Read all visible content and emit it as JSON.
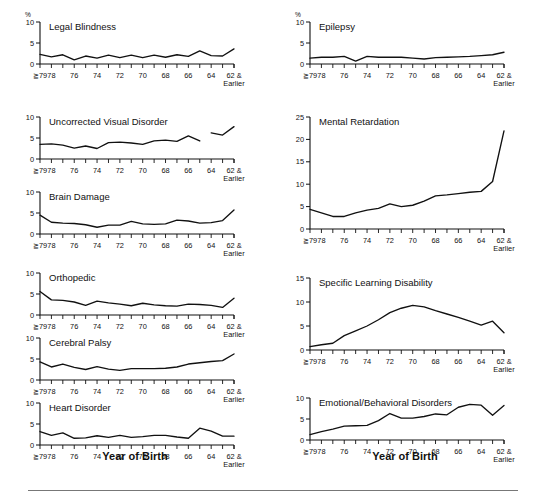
{
  "figure": {
    "axis_caption_left": "Year of Birth",
    "axis_caption_right": "Year of Birth",
    "percent_symbol": "%"
  },
  "x_axis": {
    "label": "Year of Birth",
    "tick_labels": [
      "≧79",
      "78",
      "",
      "76",
      "",
      "74",
      "",
      "72",
      "",
      "70",
      "",
      "68",
      "",
      "66",
      "",
      "64",
      "",
      "62 &"
    ],
    "end_label_line2": "Earlier",
    "categories": [
      "≧79",
      "78",
      "77",
      "76",
      "75",
      "74",
      "73",
      "72",
      "71",
      "70",
      "69",
      "68",
      "67",
      "66",
      "65",
      "64",
      "63",
      "62 & Earlier"
    ],
    "n_ticks": 18
  },
  "chart_data": [
    {
      "type": "line",
      "title": "Legal Blindness",
      "column": "left",
      "ylabel": "%",
      "ylim": [
        0,
        10
      ],
      "yticks": [
        0,
        5,
        10
      ],
      "xlabel": "Year of Birth",
      "grid": false,
      "legend": "none",
      "categories": [
        "≧79",
        "78",
        "77",
        "76",
        "75",
        "74",
        "73",
        "72",
        "71",
        "70",
        "69",
        "68",
        "67",
        "66",
        "65",
        "64",
        "63",
        "62 & Earlier"
      ],
      "values": [
        2.3,
        1.7,
        2.2,
        1.0,
        1.9,
        1.4,
        2.1,
        1.5,
        2.1,
        1.5,
        2.1,
        1.6,
        2.2,
        1.8,
        3.1,
        2.0,
        1.9,
        3.6
      ]
    },
    {
      "type": "line",
      "title": "Uncorrected Visual Disorder",
      "column": "left",
      "ylabel": "%",
      "ylim": [
        0,
        10
      ],
      "yticks": [
        0,
        5,
        10
      ],
      "xlabel": "Year of Birth",
      "grid": false,
      "legend": "none",
      "note": "line has a break between the 66 and 64 segments",
      "categories": [
        "≧79",
        "78",
        "77",
        "76",
        "75",
        "74",
        "73",
        "72",
        "71",
        "70",
        "69",
        "68",
        "67",
        "66",
        "65",
        "64",
        "63",
        "62 & Earlier"
      ],
      "values": [
        3.5,
        3.6,
        3.3,
        2.6,
        3.1,
        2.5,
        3.9,
        4.0,
        3.8,
        3.5,
        4.3,
        4.5,
        4.2,
        5.5,
        4.3,
        null,
        6.2,
        5.7,
        7.7
      ],
      "segments": [
        {
          "start_index": 0,
          "values": [
            3.5,
            3.6,
            3.3,
            2.6,
            3.1,
            2.5,
            3.9,
            4.0,
            3.8,
            3.5,
            4.3,
            4.5,
            4.2,
            5.5,
            4.3
          ]
        },
        {
          "start_index": 15,
          "values": [
            6.2,
            5.7,
            7.7
          ]
        }
      ]
    },
    {
      "type": "line",
      "title": "Brain Damage",
      "column": "left",
      "ylabel": "%",
      "ylim": [
        0,
        10
      ],
      "yticks": [
        0,
        5,
        10
      ],
      "xlabel": "Year of Birth",
      "grid": false,
      "legend": "none",
      "categories": [
        "≧79",
        "78",
        "77",
        "76",
        "75",
        "74",
        "73",
        "72",
        "71",
        "70",
        "69",
        "68",
        "67",
        "66",
        "65",
        "64",
        "63",
        "62 & Earlier"
      ],
      "values": [
        4.5,
        2.8,
        2.6,
        2.5,
        2.2,
        1.6,
        2.1,
        2.1,
        3.0,
        2.4,
        2.3,
        2.4,
        3.3,
        3.1,
        2.6,
        2.7,
        3.2,
        5.7
      ]
    },
    {
      "type": "line",
      "title": "Orthopedic",
      "column": "left",
      "ylabel": "%",
      "ylim": [
        0,
        10
      ],
      "yticks": [
        0,
        5,
        10
      ],
      "xlabel": "Year of Birth",
      "grid": false,
      "legend": "none",
      "categories": [
        "≧79",
        "78",
        "77",
        "76",
        "75",
        "74",
        "73",
        "72",
        "71",
        "70",
        "69",
        "68",
        "67",
        "66",
        "65",
        "64",
        "63",
        "62 & Earlier"
      ],
      "values": [
        5.6,
        3.6,
        3.5,
        3.1,
        2.3,
        3.3,
        2.9,
        2.6,
        2.2,
        2.8,
        2.4,
        2.2,
        2.1,
        2.6,
        2.5,
        2.3,
        1.8,
        4.0
      ]
    },
    {
      "type": "line",
      "title": "Cerebral Palsy",
      "column": "left",
      "ylabel": "%",
      "ylim": [
        0,
        10
      ],
      "yticks": [
        0,
        5,
        10
      ],
      "xlabel": "Year of Birth",
      "grid": false,
      "legend": "none",
      "categories": [
        "≧79",
        "78",
        "77",
        "76",
        "75",
        "74",
        "73",
        "72",
        "71",
        "70",
        "69",
        "68",
        "67",
        "66",
        "65",
        "64",
        "63",
        "62 & Earlier"
      ],
      "values": [
        4.3,
        3.1,
        3.8,
        3.0,
        2.5,
        3.2,
        2.6,
        2.3,
        2.7,
        2.7,
        2.7,
        2.8,
        3.1,
        3.8,
        4.1,
        4.4,
        4.6,
        6.2
      ]
    },
    {
      "type": "line",
      "title": "Heart Disorder",
      "column": "left",
      "ylabel": "%",
      "ylim": [
        0,
        10
      ],
      "yticks": [
        0,
        5,
        10
      ],
      "xlabel": "Year of Birth",
      "grid": false,
      "legend": "none",
      "categories": [
        "≧79",
        "78",
        "77",
        "76",
        "75",
        "74",
        "73",
        "72",
        "71",
        "70",
        "69",
        "68",
        "67",
        "66",
        "65",
        "64",
        "63",
        "62 & Earlier"
      ],
      "values": [
        3.2,
        2.3,
        2.9,
        1.6,
        1.7,
        2.2,
        1.8,
        2.3,
        1.8,
        2.0,
        2.3,
        2.3,
        1.9,
        1.6,
        4.0,
        3.3,
        2.1,
        2.1
      ]
    },
    {
      "type": "line",
      "title": "Epilepsy",
      "column": "right",
      "ylabel": "%",
      "ylim": [
        0,
        10
      ],
      "yticks": [
        0,
        5,
        10
      ],
      "xlabel": "Year of Birth",
      "grid": false,
      "legend": "none",
      "categories": [
        "≧79",
        "78",
        "77",
        "76",
        "75",
        "74",
        "73",
        "72",
        "71",
        "70",
        "69",
        "68",
        "67",
        "66",
        "65",
        "64",
        "63",
        "62 & Earlier"
      ],
      "values": [
        1.4,
        1.6,
        1.6,
        1.8,
        0.7,
        1.8,
        1.6,
        1.6,
        1.6,
        1.4,
        1.2,
        1.5,
        1.6,
        1.7,
        1.8,
        2.0,
        2.2,
        2.8
      ]
    },
    {
      "type": "line",
      "title": "Mental Retardation",
      "column": "right",
      "ylabel": "%",
      "ylim": [
        0,
        25
      ],
      "yticks": [
        0,
        5,
        10,
        15,
        20,
        25
      ],
      "xlabel": "Year of Birth",
      "grid": false,
      "legend": "none",
      "categories": [
        "≧79",
        "78",
        "77",
        "76",
        "75",
        "74",
        "73",
        "72",
        "71",
        "70",
        "69",
        "68",
        "67",
        "66",
        "65",
        "64",
        "63",
        "62 & Earlier"
      ],
      "values": [
        4.4,
        3.6,
        2.8,
        2.8,
        3.6,
        4.2,
        4.6,
        5.6,
        5.0,
        5.3,
        6.2,
        7.4,
        7.6,
        7.9,
        8.2,
        8.4,
        10.6,
        21.9
      ]
    },
    {
      "type": "line",
      "title": "Specific Learning Disability",
      "column": "right",
      "ylabel": "%",
      "ylim": [
        0,
        15
      ],
      "yticks": [
        0,
        5,
        10,
        15
      ],
      "xlabel": "Year of Birth",
      "grid": false,
      "legend": "none",
      "categories": [
        "≧79",
        "78",
        "77",
        "76",
        "75",
        "74",
        "73",
        "72",
        "71",
        "70",
        "69",
        "68",
        "67",
        "66",
        "65",
        "64",
        "63",
        "62 & Earlier"
      ],
      "values": [
        0.7,
        1.1,
        1.4,
        3.0,
        4.0,
        5.0,
        6.3,
        7.8,
        8.7,
        9.3,
        9.0,
        8.2,
        7.5,
        6.8,
        6.0,
        5.2,
        6.0,
        3.6
      ]
    },
    {
      "type": "line",
      "title": "Emotional/Behavioral Disorders",
      "column": "right",
      "ylabel": "%",
      "ylim": [
        0,
        10
      ],
      "yticks": [
        0,
        5,
        10
      ],
      "xlabel": "Year of Birth",
      "grid": false,
      "legend": "none",
      "categories": [
        "≧79",
        "78",
        "77",
        "76",
        "75",
        "74",
        "73",
        "72",
        "71",
        "70",
        "69",
        "68",
        "67",
        "66",
        "65",
        "64",
        "63",
        "62 & Earlier"
      ],
      "values": [
        1.3,
        2.0,
        2.6,
        3.3,
        3.4,
        3.5,
        4.6,
        6.3,
        5.2,
        5.2,
        5.6,
        6.2,
        6.0,
        7.8,
        8.5,
        8.3,
        5.9,
        8.2
      ]
    }
  ]
}
